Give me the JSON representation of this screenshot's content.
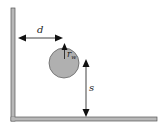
{
  "diagram": {
    "labels": {
      "d": "d",
      "r": "r",
      "r_sub": "w",
      "s": "s"
    },
    "colors": {
      "wall_fill": "#b8b8b8",
      "wall_stroke": "#555555",
      "ball_fill": "#b0b0b0",
      "ball_stroke": "#555555",
      "arrow": "#111111"
    }
  }
}
